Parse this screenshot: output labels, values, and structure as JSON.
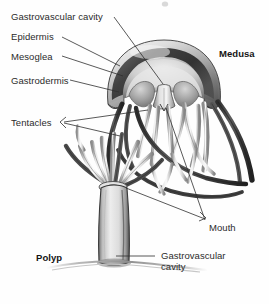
{
  "figure": {
    "background_color": "#fefefe",
    "ink_color": "#2b2b2b",
    "width": 269,
    "height": 304
  },
  "labels": {
    "gastrovascular_cavity_top": "Gastrovascular cavity",
    "epidermis": "Epidermis",
    "mesoglea": "Mesoglea",
    "gastrodermis": "Gastrodermis",
    "tentacles": "Tentacles",
    "medusa": "Medusa",
    "mouth": "Mouth",
    "polyp": "Polyp",
    "gastrovascular_cavity_bottom": "Gastrovascular\ncavity"
  },
  "structures": {
    "medusa_bell": "medusa-bell",
    "medusa_manubrium": "medusa-manubrium",
    "medusa_tentacles": "medusa-tentacles",
    "polyp_stalk": "polyp-stalk",
    "polyp_tentacles": "polyp-tentacles",
    "substrate_line": "substrate-line"
  },
  "palette": {
    "outline": "#2f2f2f",
    "dark_tissue": "#4a4a4a",
    "mid_tissue": "#8e8e8e",
    "light_tissue": "#d2d2d2",
    "pale_tissue": "#ededed",
    "shadow": "#1e1e1e"
  }
}
